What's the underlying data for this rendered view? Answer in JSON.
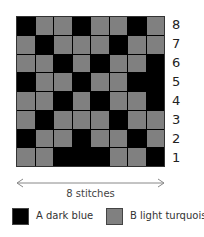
{
  "colors": {
    "A": "#000000",
    "B": "#808080"
  },
  "chart": {
    "rows_top_to_bottom": [
      [
        "A",
        "B",
        "B",
        "A",
        "B",
        "B",
        "A",
        "B"
      ],
      [
        "B",
        "A",
        "B",
        "B",
        "B",
        "A",
        "B",
        "B"
      ],
      [
        "B",
        "B",
        "A",
        "B",
        "A",
        "B",
        "B",
        "A"
      ],
      [
        "A",
        "B",
        "B",
        "A",
        "B",
        "B",
        "A",
        "A"
      ],
      [
        "B",
        "B",
        "A",
        "B",
        "A",
        "B",
        "B",
        "A"
      ],
      [
        "B",
        "A",
        "B",
        "B",
        "B",
        "A",
        "B",
        "B"
      ],
      [
        "A",
        "B",
        "B",
        "A",
        "B",
        "B",
        "A",
        "B"
      ],
      [
        "B",
        "B",
        "A",
        "A",
        "A",
        "B",
        "B",
        "A"
      ]
    ],
    "row_labels_top_to_bottom": [
      "8",
      "7",
      "6",
      "5",
      "4",
      "3",
      "2",
      "1"
    ],
    "width_label": "8 stitches"
  },
  "legend": [
    {
      "key": "A",
      "label": "A dark blue"
    },
    {
      "key": "B",
      "label": "B light turquoise"
    }
  ]
}
